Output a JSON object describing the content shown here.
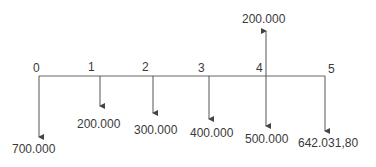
{
  "diagram": {
    "type": "cash-flow-timeline",
    "line_color": "#555555",
    "periods": [
      {
        "label": "0"
      },
      {
        "label": "1"
      },
      {
        "label": "2"
      },
      {
        "label": "3"
      },
      {
        "label": "4"
      },
      {
        "label": "5"
      }
    ],
    "flows": [
      {
        "period": "0",
        "direction": "out",
        "amount": "700.000"
      },
      {
        "period": "1",
        "direction": "out",
        "amount": "200.000"
      },
      {
        "period": "2",
        "direction": "out",
        "amount": "300.000"
      },
      {
        "period": "3",
        "direction": "out",
        "amount": "400.000"
      },
      {
        "period": "4",
        "direction": "in",
        "amount": "200.000"
      },
      {
        "period": "4",
        "direction": "out",
        "amount": "500.000"
      },
      {
        "period": "5",
        "direction": "out",
        "amount": "642.031,80"
      }
    ]
  }
}
